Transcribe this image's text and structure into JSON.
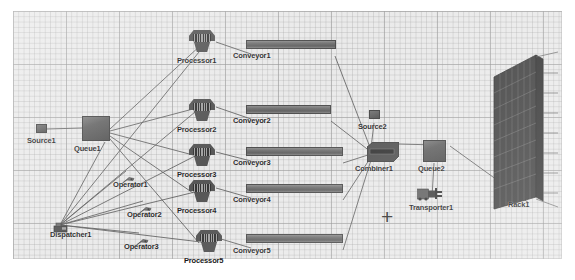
{
  "view": {
    "app": "simulation-model-view",
    "background_color": "#e9e9e9",
    "grid_color": "#969696",
    "canvas": {
      "x": 13,
      "y": 11,
      "width": 549,
      "height": 248
    }
  },
  "markers": [
    {
      "name": "origin-crosshair",
      "glyph": "+",
      "x": 381,
      "y": 216
    }
  ],
  "objects": [
    {
      "id": "source1",
      "label": "Source1",
      "type": "source",
      "x": 36,
      "y": 124,
      "w": 11,
      "h": 9,
      "label_x": 27,
      "label_y": 136
    },
    {
      "id": "queue1",
      "label": "Queue1",
      "type": "queue",
      "x": 82,
      "y": 116,
      "w": 28,
      "h": 25,
      "label_x": 74,
      "label_y": 144
    },
    {
      "id": "dispatcher1",
      "label": "Dispatcher1",
      "type": "dispatcher",
      "x": 53,
      "y": 219,
      "w": 15,
      "h": 10,
      "label_x": 50,
      "label_y": 230
    },
    {
      "id": "operator1",
      "label": "Operator1",
      "type": "operator",
      "x": 122,
      "y": 170,
      "w": 11,
      "h": 7,
      "label_x": 113,
      "label_y": 180
    },
    {
      "id": "operator2",
      "label": "Operator2",
      "type": "operator",
      "x": 139,
      "y": 200,
      "w": 11,
      "h": 7,
      "label_x": 127,
      "label_y": 210
    },
    {
      "id": "operator3",
      "label": "Operator3",
      "type": "operator",
      "x": 136,
      "y": 232,
      "w": 11,
      "h": 7,
      "label_x": 124,
      "label_y": 242
    },
    {
      "id": "processor1",
      "label": "Processor1",
      "type": "processor",
      "x": 189,
      "y": 30,
      "w": 26,
      "h": 22,
      "label_x": 177,
      "label_y": 56
    },
    {
      "id": "processor2",
      "label": "Processor2",
      "type": "processor",
      "x": 189,
      "y": 99,
      "w": 26,
      "h": 22,
      "label_x": 177,
      "label_y": 125
    },
    {
      "id": "processor3",
      "label": "Processor3",
      "type": "processor",
      "x": 189,
      "y": 144,
      "w": 26,
      "h": 22,
      "label_x": 177,
      "label_y": 170
    },
    {
      "id": "processor4",
      "label": "Processor4",
      "type": "processor",
      "x": 189,
      "y": 180,
      "w": 26,
      "h": 22,
      "label_x": 177,
      "label_y": 206
    },
    {
      "id": "processor5",
      "label": "Processor5",
      "type": "processor",
      "x": 196,
      "y": 230,
      "w": 26,
      "h": 22,
      "label_x": 184,
      "label_y": 256
    },
    {
      "id": "conveyor1",
      "label": "Conveyor1",
      "type": "conveyor",
      "x": 246,
      "y": 40,
      "w": 90,
      "h": 9,
      "label_x": 233,
      "label_y": 51
    },
    {
      "id": "conveyor2",
      "label": "Conveyor2",
      "type": "conveyor",
      "x": 246,
      "y": 105,
      "w": 85,
      "h": 9,
      "label_x": 233,
      "label_y": 116
    },
    {
      "id": "conveyor3",
      "label": "Conveyor3",
      "type": "conveyor",
      "x": 246,
      "y": 147,
      "w": 96,
      "h": 9,
      "label_x": 233,
      "label_y": 158
    },
    {
      "id": "conveyor4",
      "label": "Conveyor4",
      "type": "conveyor",
      "x": 246,
      "y": 184,
      "w": 96,
      "h": 9,
      "label_x": 233,
      "label_y": 195
    },
    {
      "id": "conveyor5",
      "label": "Conveyor5",
      "type": "conveyor",
      "x": 246,
      "y": 234,
      "w": 96,
      "h": 9,
      "label_x": 233,
      "label_y": 246
    },
    {
      "id": "source2",
      "label": "Source2",
      "type": "source",
      "x": 369,
      "y": 110,
      "w": 11,
      "h": 9,
      "label_x": 358,
      "label_y": 122
    },
    {
      "id": "combiner1",
      "label": "Combiner1",
      "type": "combiner",
      "x": 367,
      "y": 142,
      "w": 31,
      "h": 19,
      "label_x": 355,
      "label_y": 164
    },
    {
      "id": "queue2",
      "label": "Queue2",
      "type": "queue",
      "x": 423,
      "y": 140,
      "w": 23,
      "h": 22,
      "label_x": 418,
      "label_y": 164
    },
    {
      "id": "transporter1",
      "label": "Transporter1",
      "type": "transporter",
      "x": 417,
      "y": 187,
      "w": 23,
      "h": 13,
      "label_x": 409,
      "label_y": 203
    },
    {
      "id": "rack1",
      "label": "Rack1",
      "type": "rack",
      "x": 493,
      "y": 53,
      "w": 50,
      "h": 148,
      "label_x": 508,
      "label_y": 200
    }
  ],
  "connections": [
    {
      "from": "source1",
      "to": "queue1"
    },
    {
      "from": "queue1",
      "to": "processor1"
    },
    {
      "from": "queue1",
      "to": "processor2"
    },
    {
      "from": "queue1",
      "to": "processor3"
    },
    {
      "from": "queue1",
      "to": "processor4"
    },
    {
      "from": "queue1",
      "to": "processor5"
    },
    {
      "from": "processor1",
      "to": "conveyor1"
    },
    {
      "from": "processor2",
      "to": "conveyor2"
    },
    {
      "from": "processor3",
      "to": "conveyor3"
    },
    {
      "from": "processor4",
      "to": "conveyor4"
    },
    {
      "from": "processor5",
      "to": "conveyor5"
    },
    {
      "from": "conveyor1",
      "to": "combiner1"
    },
    {
      "from": "conveyor2",
      "to": "combiner1"
    },
    {
      "from": "conveyor3",
      "to": "combiner1"
    },
    {
      "from": "conveyor4",
      "to": "combiner1"
    },
    {
      "from": "conveyor5",
      "to": "combiner1"
    },
    {
      "from": "source2",
      "to": "combiner1"
    },
    {
      "from": "combiner1",
      "to": "queue2"
    },
    {
      "from": "queue2",
      "to": "transporter1"
    },
    {
      "from": "queue2",
      "to": "rack1"
    },
    {
      "from": "dispatcher1",
      "to": "queue1"
    },
    {
      "from": "dispatcher1",
      "to": "operator1"
    },
    {
      "from": "dispatcher1",
      "to": "operator2"
    },
    {
      "from": "dispatcher1",
      "to": "operator3"
    },
    {
      "from": "dispatcher1",
      "to": "processor1"
    },
    {
      "from": "dispatcher1",
      "to": "processor2"
    },
    {
      "from": "dispatcher1",
      "to": "processor3"
    },
    {
      "from": "dispatcher1",
      "to": "processor4"
    },
    {
      "from": "dispatcher1",
      "to": "processor5"
    }
  ]
}
